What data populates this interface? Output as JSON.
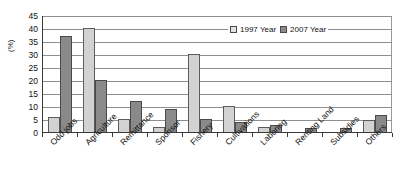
{
  "chart_data": {
    "type": "bar",
    "title": "",
    "xlabel": "",
    "ylabel": "(%)",
    "ylim": [
      0,
      45
    ],
    "ytick_step": 5,
    "yticks": [
      45,
      40,
      35,
      30,
      25,
      20,
      15,
      10,
      5,
      0
    ],
    "grid": true,
    "legend_position": "top-right",
    "categories": [
      "Odd jobs",
      "Agriculture",
      "Remittance",
      "Sponsor",
      "Fishery",
      "Cultivations",
      "Laboring",
      "Renting Land",
      "Subsidies",
      "Others"
    ],
    "series": [
      {
        "name": "1997 Year",
        "color": "#d2d2d2",
        "values": [
          5.8,
          40.0,
          4.9,
          2.0,
          30.0,
          10.0,
          1.8,
          0.0,
          0.0,
          4.5
        ]
      },
      {
        "name": "2007 Year",
        "color": "#8a8a8a",
        "values": [
          37.0,
          20.0,
          11.8,
          9.0,
          4.9,
          4.0,
          2.8,
          1.5,
          1.4,
          6.5
        ]
      }
    ]
  },
  "legend": {
    "items": [
      {
        "label": "1997 Year"
      },
      {
        "label": "2007 Year"
      }
    ]
  },
  "colors": {
    "series_1997": "#d2d2d2",
    "series_2007": "#8a8a8a",
    "axis": "#3a3a3a",
    "grid": "#8f8f8f",
    "text": "#111111",
    "background": "#ffffff"
  }
}
